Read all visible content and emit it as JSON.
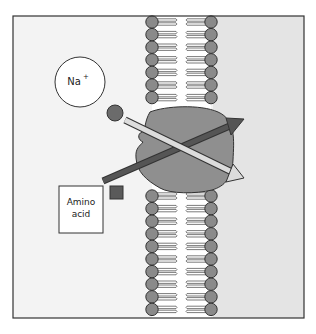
{
  "diagram": {
    "type": "membrane-cotransport",
    "labels": {
      "sodium_ion": "Na",
      "sodium_charge": "+",
      "amino_acid_line1": "Amino",
      "amino_acid_line2": "acid"
    },
    "colors": {
      "outside_bg": "#f3f3f3",
      "inside_bg": "#e4e4e4",
      "border": "#333333",
      "phospholipid_head": "#8a8a8a",
      "phospholipid_tail": "#ffffff",
      "protein": "#8f8f8f",
      "sodium_arrow": "#d9d9d9",
      "amino_acid_arrow": "#555555",
      "sodium_particle": "#6b6b6b",
      "amino_acid_particle": "#5a5a5a"
    }
  }
}
